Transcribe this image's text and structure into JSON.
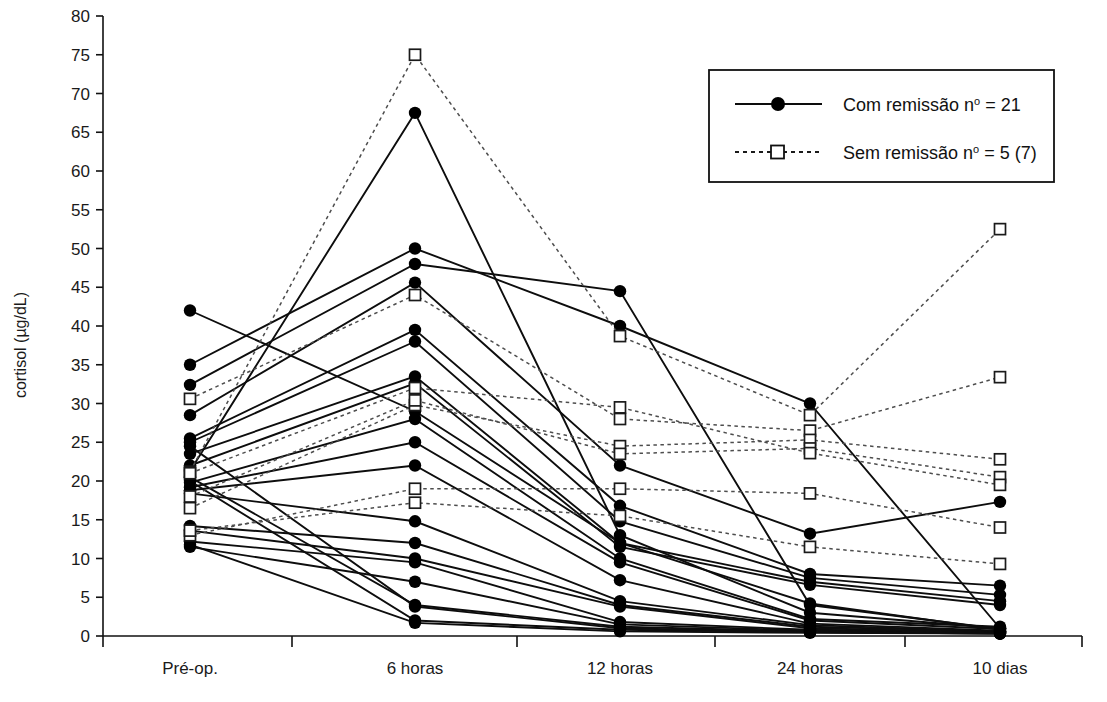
{
  "chart_data": {
    "type": "line",
    "title": "",
    "xlabel": "",
    "ylabel": "cortisol  (µg/dL)",
    "categories": [
      "Pré-op.",
      "6 horas",
      "12 horas",
      "24 horas",
      "10 dias"
    ],
    "ylim": [
      0,
      80
    ],
    "ytick_step": 5,
    "yticks": [
      0,
      5,
      10,
      15,
      20,
      25,
      30,
      35,
      40,
      45,
      50,
      55,
      60,
      65,
      70,
      75,
      80
    ],
    "ytick_labels": [
      "0",
      "5",
      "10",
      "15",
      "20",
      "25",
      "30",
      "35",
      "40",
      "45",
      "50",
      "55",
      "60",
      "65",
      "70",
      "75",
      "80"
    ],
    "grid": false,
    "legend_position": "top-right",
    "legend": [
      {
        "key": "com_remissao",
        "label": "Com remissão nº = 21",
        "label_text": "Com remissão n",
        "label_sup": "o",
        "label_tail": " = 21",
        "line": "solid",
        "marker": "filled-circle",
        "color": "#000000"
      },
      {
        "key": "sem_remissao",
        "label": "Sem remissão nº = 5 (7)",
        "label_text": "Sem remissão n",
        "label_sup": "o",
        "label_tail": " = 5 (7)",
        "line": "dotted",
        "marker": "open-square",
        "color": "#555555"
      }
    ],
    "series": [
      {
        "name": "Com remissão 1",
        "group": "com_remissao",
        "values": [
          42.0,
          29.0,
          12.0,
          4.2,
          0.8
        ]
      },
      {
        "name": "Com remissão 2",
        "group": "com_remissao",
        "values": [
          35.0,
          50.0,
          40.0,
          30.0,
          1.0
        ]
      },
      {
        "name": "Com remissão 3",
        "group": "com_remissao",
        "values": [
          32.4,
          48.0,
          44.5,
          4.0,
          0.9
        ]
      },
      {
        "name": "Com remissão 4",
        "group": "com_remissao",
        "values": [
          28.5,
          45.6,
          22.0,
          13.2,
          17.3
        ]
      },
      {
        "name": "Com remissão 5",
        "group": "com_remissao",
        "values": [
          25.5,
          39.5,
          16.8,
          8.0,
          6.5
        ]
      },
      {
        "name": "Com remissão 6",
        "group": "com_remissao",
        "values": [
          25.0,
          38.0,
          14.8,
          7.5,
          5.3
        ]
      },
      {
        "name": "Com remissão 7",
        "group": "com_remissao",
        "values": [
          23.5,
          33.5,
          12.0,
          7.0,
          4.5
        ]
      },
      {
        "name": "Com remissão 8",
        "group": "com_remissao",
        "values": [
          22.0,
          32.6,
          11.5,
          6.6,
          4.0
        ]
      },
      {
        "name": "Com remissão 9",
        "group": "com_remissao",
        "values": [
          21.3,
          67.5,
          13.0,
          3.0,
          1.0
        ]
      },
      {
        "name": "Com remissão 10",
        "group": "com_remissao",
        "values": [
          19.8,
          28.0,
          10.0,
          2.2,
          1.2
        ]
      },
      {
        "name": "Com remissão 11",
        "group": "com_remissao",
        "values": [
          19.2,
          25.0,
          9.5,
          2.0,
          0.9
        ]
      },
      {
        "name": "Com remissão 12",
        "group": "com_remissao",
        "values": [
          18.8,
          22.0,
          7.2,
          1.6,
          0.7
        ]
      },
      {
        "name": "Com remissão 13",
        "group": "com_remissao",
        "values": [
          18.4,
          14.8,
          4.5,
          1.4,
          0.6
        ]
      },
      {
        "name": "Com remissão 14",
        "group": "com_remissao",
        "values": [
          14.2,
          12.0,
          4.0,
          1.2,
          0.6
        ]
      },
      {
        "name": "Com remissão 15",
        "group": "com_remissao",
        "values": [
          13.6,
          10.0,
          3.8,
          1.0,
          0.5
        ]
      },
      {
        "name": "Com remissão 16",
        "group": "com_remissao",
        "values": [
          12.2,
          9.5,
          1.8,
          0.8,
          0.5
        ]
      },
      {
        "name": "Com remissão 17",
        "group": "com_remissao",
        "values": [
          11.5,
          7.0,
          1.5,
          0.7,
          0.4
        ]
      },
      {
        "name": "Com remissão 18",
        "group": "com_remissao",
        "values": [
          20.5,
          4.0,
          1.2,
          0.6,
          0.4
        ]
      },
      {
        "name": "Com remissão 19",
        "group": "com_remissao",
        "values": [
          24.5,
          3.8,
          1.0,
          0.5,
          0.3
        ]
      },
      {
        "name": "Com remissão 20",
        "group": "com_remissao",
        "values": [
          20.0,
          2.0,
          0.8,
          0.5,
          0.3
        ]
      },
      {
        "name": "Com remissão 21",
        "group": "com_remissao",
        "values": [
          11.8,
          1.7,
          0.6,
          0.4,
          0.3
        ]
      },
      {
        "name": "Sem remissão 1",
        "group": "sem_remissao",
        "values": [
          21.2,
          75.0,
          38.7,
          28.5,
          52.5
        ]
      },
      {
        "name": "Sem remissão 2",
        "group": "sem_remissao",
        "values": [
          30.6,
          44.0,
          28.0,
          26.5,
          33.4
        ]
      },
      {
        "name": "Sem remissão 3",
        "group": "sem_remissao",
        "values": [
          16.5,
          29.8,
          24.5,
          25.3,
          22.8
        ]
      },
      {
        "name": "Sem remissão 4",
        "group": "sem_remissao",
        "values": [
          18.0,
          30.4,
          23.5,
          24.2,
          20.5
        ]
      },
      {
        "name": "Sem remissão 5",
        "group": "sem_remissao",
        "values": [
          21.0,
          32.0,
          29.5,
          23.6,
          19.5
        ]
      },
      {
        "name": "Sem remissão 6",
        "group": "sem_remissao",
        "values": [
          13.0,
          19.0,
          19.0,
          18.4,
          14.0
        ]
      },
      {
        "name": "Sem remissão 7",
        "group": "sem_remissao",
        "values": [
          13.6,
          17.2,
          15.5,
          11.5,
          9.3
        ]
      }
    ]
  },
  "axis": {
    "y_title": "cortisol  (µg/dL)"
  }
}
